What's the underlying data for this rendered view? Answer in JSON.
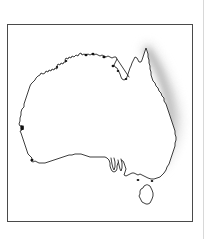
{
  "figure": {
    "kind": "map-figure",
    "frame": {
      "visible": true,
      "x": 7,
      "y": 24,
      "width": 186,
      "height": 198,
      "border_color": "#4a4a4a",
      "border_width": 1
    },
    "background_color": "#ffffff",
    "page_edge": {
      "visible": true,
      "x": 203,
      "color": "#d8d8d8"
    }
  },
  "map": {
    "name": "australia-outline-map",
    "outline_color": "#1a1a1a",
    "outline_width": 0.85,
    "land_fill": "#ffffff",
    "labels": [],
    "features": [
      {
        "name": "mainland-australia",
        "type": "landmass",
        "fill": "#ffffff",
        "stroke": "#1a1a1a"
      },
      {
        "name": "tasmania",
        "type": "island",
        "fill": "#ffffff",
        "stroke": "#1a1a1a"
      },
      {
        "name": "gulf-of-carpentaria-islets",
        "type": "islet-dots",
        "fill": "#111111"
      },
      {
        "name": "west-coast-marker",
        "type": "marker-dot",
        "fill": "#111111"
      }
    ]
  },
  "highlight": {
    "name": "east-coast-highlight",
    "label": "",
    "description": "soft grey shaded band along the eastern seaboard",
    "color_inner": "#b5b5b5",
    "color_outer": "#e6e6e6",
    "start_region": "cape-york",
    "end_region": "northern-new-south-wales",
    "opacity": 0.85
  }
}
